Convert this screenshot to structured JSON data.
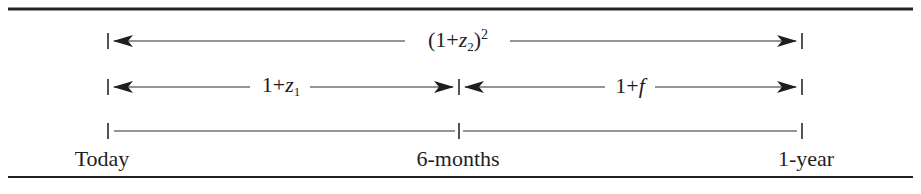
{
  "diagram": {
    "colors": {
      "line": "#2a2a2a",
      "text": "#1e1e1e",
      "background": "#ffffff"
    },
    "timeline": {
      "points": [
        {
          "id": "today",
          "label": "Today",
          "x": 108
        },
        {
          "id": "six-months",
          "label": "6-months",
          "x": 459
        },
        {
          "id": "one-year",
          "label": "1-year",
          "x": 802
        }
      ]
    },
    "rows": [
      {
        "id": "two-year-spot",
        "from": "Today",
        "to": "1-year",
        "label_parts": [
          "(1+",
          "z",
          "2",
          ")",
          "2"
        ],
        "label_text": "(1+z2)^2",
        "y": 41
      },
      {
        "id": "six-month-spot",
        "from": "Today",
        "to": "6-months",
        "label_parts": [
          "1+",
          "z",
          "1"
        ],
        "label_text": "1+z1",
        "y": 87
      },
      {
        "id": "forward",
        "from": "6-months",
        "to": "1-year",
        "label_parts": [
          "1+",
          "f"
        ],
        "label_text": "1+f",
        "y": 87
      },
      {
        "id": "timeline-row",
        "y": 131
      }
    ]
  }
}
